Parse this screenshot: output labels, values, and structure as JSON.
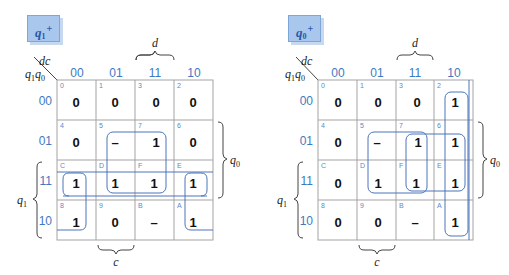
{
  "maps": [
    {
      "title": "q",
      "title_sub": "1",
      "title_sup": "+",
      "corner_top": "dc",
      "corner_bottom": "q1q0",
      "col_headers": [
        "00",
        "01",
        "11",
        "10"
      ],
      "row_headers": [
        "00",
        "01",
        "11",
        "10"
      ],
      "cells": [
        [
          {
            "idx": "0",
            "val": "0"
          },
          {
            "idx": "1",
            "val": "0"
          },
          {
            "idx": "3",
            "val": "0"
          },
          {
            "idx": "2",
            "val": "0"
          }
        ],
        [
          {
            "idx": "4",
            "val": "0"
          },
          {
            "idx": "5",
            "val": "–"
          },
          {
            "idx": "7",
            "val": "1"
          },
          {
            "idx": "6",
            "val": "0"
          }
        ],
        [
          {
            "idx": "C",
            "val": "1"
          },
          {
            "idx": "D",
            "val": "1"
          },
          {
            "idx": "F",
            "val": "1"
          },
          {
            "idx": "E",
            "val": "1"
          }
        ],
        [
          {
            "idx": "8",
            "val": "1"
          },
          {
            "idx": "9",
            "val": "0"
          },
          {
            "idx": "B",
            "val": "–"
          },
          {
            "idx": "A",
            "val": "1"
          }
        ]
      ],
      "brace_labels": {
        "top": "d",
        "bottom": "c",
        "right": "q0",
        "left": "q1"
      }
    },
    {
      "title": "q",
      "title_sub": "0",
      "title_sup": "+",
      "corner_top": "dc",
      "corner_bottom": "q1q0",
      "col_headers": [
        "00",
        "01",
        "11",
        "10"
      ],
      "row_headers": [
        "00",
        "01",
        "11",
        "10"
      ],
      "cells": [
        [
          {
            "idx": "0",
            "val": "0"
          },
          {
            "idx": "1",
            "val": "0"
          },
          {
            "idx": "3",
            "val": "0"
          },
          {
            "idx": "2",
            "val": "1"
          }
        ],
        [
          {
            "idx": "4",
            "val": "0"
          },
          {
            "idx": "5",
            "val": "–"
          },
          {
            "idx": "7",
            "val": "1"
          },
          {
            "idx": "6",
            "val": "1"
          }
        ],
        [
          {
            "idx": "C",
            "val": "0"
          },
          {
            "idx": "D",
            "val": "1"
          },
          {
            "idx": "F",
            "val": "1"
          },
          {
            "idx": "E",
            "val": "1"
          }
        ],
        [
          {
            "idx": "8",
            "val": "0"
          },
          {
            "idx": "9",
            "val": "0"
          },
          {
            "idx": "B",
            "val": "–"
          },
          {
            "idx": "A",
            "val": "1"
          }
        ]
      ],
      "brace_labels": {
        "top": "d",
        "bottom": "c",
        "right": "q0",
        "left": "q1"
      }
    }
  ],
  "colors": {
    "accent": "#3f78c2",
    "group_outline": "#4a74bb",
    "title_bg": "#a9c6ec",
    "grid": "#a3a3a3"
  }
}
